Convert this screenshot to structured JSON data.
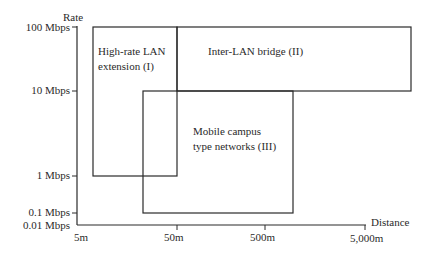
{
  "diagram": {
    "y_axis": {
      "title": "Rate",
      "ticks": [
        "100 Mbps",
        "10 Mbps",
        "1 Mbps",
        "0.1 Mbps",
        "0.01 Mbps"
      ]
    },
    "x_axis": {
      "title": "Distance",
      "ticks": [
        "5m",
        "50m",
        "500m",
        "5,000m"
      ]
    },
    "regions": [
      {
        "label_line1": "High-rate LAN",
        "label_line2": "extension (I)",
        "distance": [
          "~7m",
          "50m"
        ],
        "rate": [
          "1 Mbps",
          "100 Mbps"
        ]
      },
      {
        "label_line1": "Inter-LAN bridge (II)",
        "distance": [
          "50m",
          ">5,000m"
        ],
        "rate": [
          "10 Mbps",
          "100 Mbps"
        ]
      },
      {
        "label_line1": "Mobile campus",
        "label_line2": "type networks (III)",
        "distance": [
          "~20m",
          "~1,000m"
        ],
        "rate": [
          "0.1 Mbps",
          "10 Mbps"
        ]
      }
    ],
    "colors": {
      "line": "#2a2a2a",
      "background": "#ffffff"
    }
  }
}
